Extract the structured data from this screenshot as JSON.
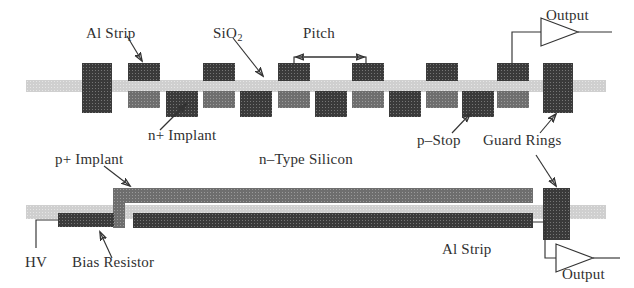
{
  "figure": {
    "type": "diagram",
    "panels": [
      {
        "name": "top-view-panel",
        "description": "Cross-section across strips showing pitch"
      },
      {
        "name": "side-view-panel",
        "description": "Cross-section along a single strip"
      }
    ]
  },
  "labels": {
    "al_strip_top": "Al Strip",
    "sio2": "SiO",
    "sio2_sub": "2",
    "pitch": "Pitch",
    "output_top": "Output",
    "n_implant": "n+ Implant",
    "p_stop": "p–Stop",
    "guard_rings": "Guard Rings",
    "p_implant": "p+ Implant",
    "n_type_silicon": "n–Type Silicon",
    "hv": "HV",
    "bias_resistor": "Bias Resistor",
    "al_strip_bottom": "Al Strip",
    "output_bottom": "Output"
  },
  "colors": {
    "metal_dark": "#3a3a3a",
    "implant_mid": "#6e6e6e",
    "oxide_light": "#cfcfcf",
    "line": "#333333",
    "background": "#ffffff",
    "text": "#303030"
  },
  "top_panel": {
    "oxide_band": {
      "x": 26,
      "y": 80,
      "w": 580,
      "h": 12
    },
    "al_strips": [
      {
        "x": 128,
        "y": 63,
        "w": 32,
        "h": 18
      },
      {
        "x": 203,
        "y": 63,
        "w": 32,
        "h": 18
      },
      {
        "x": 278,
        "y": 63,
        "w": 32,
        "h": 18
      },
      {
        "x": 352,
        "y": 63,
        "w": 32,
        "h": 18
      },
      {
        "x": 426,
        "y": 63,
        "w": 32,
        "h": 18
      },
      {
        "x": 497,
        "y": 63,
        "w": 32,
        "h": 18
      }
    ],
    "implants_mid": [
      {
        "x": 128,
        "y": 91,
        "w": 32,
        "h": 17
      },
      {
        "x": 203,
        "y": 91,
        "w": 32,
        "h": 17
      },
      {
        "x": 278,
        "y": 91,
        "w": 32,
        "h": 17
      },
      {
        "x": 352,
        "y": 91,
        "w": 32,
        "h": 17
      },
      {
        "x": 426,
        "y": 91,
        "w": 32,
        "h": 17
      },
      {
        "x": 497,
        "y": 91,
        "w": 32,
        "h": 17
      }
    ],
    "p_stops_dark": [
      {
        "x": 166,
        "y": 91,
        "w": 32,
        "h": 26
      },
      {
        "x": 240,
        "y": 91,
        "w": 32,
        "h": 26
      },
      {
        "x": 315,
        "y": 91,
        "w": 32,
        "h": 26
      },
      {
        "x": 389,
        "y": 91,
        "w": 32,
        "h": 26
      },
      {
        "x": 462,
        "y": 91,
        "w": 32,
        "h": 26
      }
    ],
    "guard_rings": [
      {
        "x": 82,
        "y": 63,
        "w": 30,
        "h": 50
      },
      {
        "x": 543,
        "y": 63,
        "w": 30,
        "h": 50
      }
    ],
    "pitch_span": {
      "from_x": 293,
      "to_x": 367,
      "y": 56
    }
  },
  "bottom_panel": {
    "oxide_band": {
      "x": 26,
      "y": 205,
      "w": 580,
      "h": 14
    },
    "p_implant_bar": {
      "x": 113,
      "y": 188,
      "w": 420,
      "h": 14
    },
    "bias_resistor_bar": {
      "x": 58,
      "y": 213,
      "w": 56,
      "h": 13
    },
    "al_strip_bar": {
      "x": 133,
      "y": 213,
      "w": 400,
      "h": 14
    },
    "guard_ring": {
      "x": 543,
      "y": 188,
      "w": 27,
      "h": 52
    }
  }
}
